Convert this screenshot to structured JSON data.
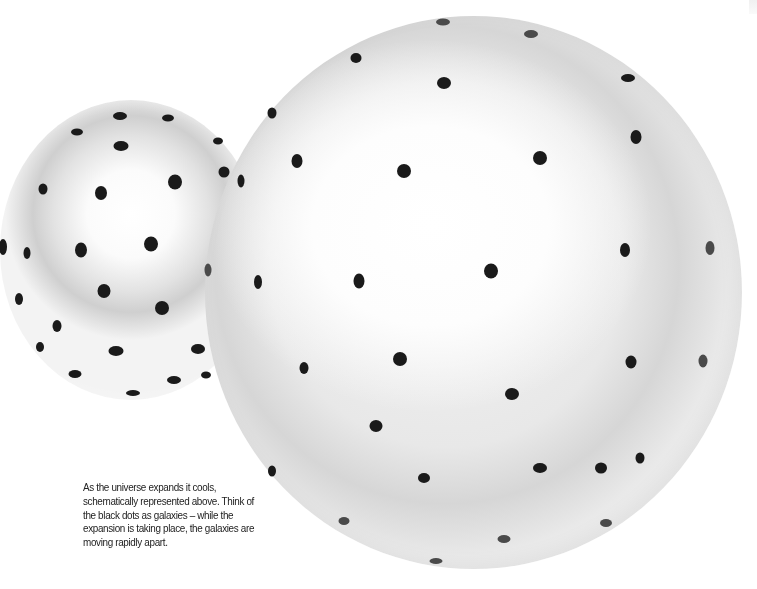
{
  "caption": {
    "text": "As the universe expands it cools, schematically represented above. Think of the black dots as galaxies – while the expansion is taking place, the galaxies are moving rapidly apart."
  },
  "scene": {
    "small_sphere": {
      "label": "smaller universe sphere",
      "dots": [
        [
          120,
          116,
          14,
          8
        ],
        [
          168,
          118,
          12,
          7
        ],
        [
          77,
          132,
          12,
          7
        ],
        [
          121,
          146,
          15,
          10
        ],
        [
          218,
          141,
          10,
          7
        ],
        [
          224,
          172,
          11,
          11
        ],
        [
          43,
          189,
          9,
          11
        ],
        [
          101,
          193,
          12,
          14
        ],
        [
          175,
          182,
          14,
          15
        ],
        [
          3,
          247,
          8,
          16
        ],
        [
          27,
          253,
          7,
          12
        ],
        [
          81,
          250,
          12,
          15
        ],
        [
          151,
          244,
          14,
          15
        ],
        [
          104,
          291,
          13,
          14
        ],
        [
          162,
          308,
          14,
          14
        ],
        [
          19,
          299,
          8,
          12
        ],
        [
          57,
          326,
          9,
          12
        ],
        [
          116,
          351,
          15,
          10
        ],
        [
          198,
          349,
          14,
          10
        ],
        [
          40,
          347,
          8,
          10
        ],
        [
          75,
          374,
          13,
          8
        ],
        [
          174,
          380,
          14,
          8
        ],
        [
          133,
          393,
          14,
          6
        ],
        [
          206,
          375,
          10,
          7
        ]
      ]
    },
    "large_sphere": {
      "label": "larger universe sphere",
      "dots": [
        [
          443,
          22,
          14,
          7
        ],
        [
          531,
          34,
          14,
          8
        ],
        [
          356,
          58,
          11,
          10
        ],
        [
          444,
          83,
          14,
          12
        ],
        [
          628,
          78,
          14,
          8
        ],
        [
          272,
          113,
          9,
          11
        ],
        [
          636,
          137,
          11,
          14
        ],
        [
          297,
          161,
          11,
          14
        ],
        [
          404,
          171,
          14,
          14
        ],
        [
          540,
          158,
          14,
          14
        ],
        [
          241,
          181,
          7,
          13
        ],
        [
          625,
          250,
          10,
          14
        ],
        [
          710,
          248,
          9,
          14
        ],
        [
          208,
          270,
          7,
          13
        ],
        [
          258,
          282,
          8,
          14
        ],
        [
          359,
          281,
          11,
          15
        ],
        [
          491,
          271,
          14,
          15
        ],
        [
          400,
          359,
          14,
          14
        ],
        [
          304,
          368,
          9,
          12
        ],
        [
          512,
          394,
          14,
          12
        ],
        [
          631,
          362,
          11,
          13
        ],
        [
          703,
          361,
          9,
          13
        ],
        [
          272,
          471,
          8,
          11
        ],
        [
          376,
          426,
          13,
          12
        ],
        [
          424,
          478,
          12,
          10
        ],
        [
          540,
          468,
          14,
          10
        ],
        [
          601,
          468,
          12,
          11
        ],
        [
          640,
          458,
          9,
          11
        ],
        [
          344,
          521,
          11,
          8
        ],
        [
          504,
          539,
          13,
          8
        ],
        [
          606,
          523,
          12,
          8
        ],
        [
          436,
          561,
          13,
          6
        ]
      ]
    }
  }
}
